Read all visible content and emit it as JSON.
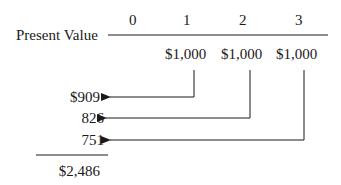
{
  "timeline": {
    "label": "Present Value",
    "periods": [
      "0",
      "1",
      "2",
      "3"
    ]
  },
  "cash_flows": [
    "$1,000",
    "$1,000",
    "$1,000"
  ],
  "present_values": [
    "$909",
    "826",
    "751"
  ],
  "total": "$2,486",
  "colors": {
    "ink": "#1a1a1a",
    "background": "#ffffff"
  }
}
